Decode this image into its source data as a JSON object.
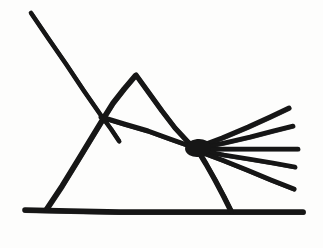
{
  "figure": {
    "title": "Hand-drawn line figure",
    "background_color": "#fdfdfc",
    "ink_color": "#161616",
    "canvas": {
      "width": 323,
      "height": 248
    },
    "stroke_width": 5.2,
    "parts": [
      {
        "name": "long-diagonal",
        "label": "Long diagonal from upper left"
      },
      {
        "name": "baseline",
        "label": "Horizontal baseline"
      },
      {
        "name": "triangle-left-leg",
        "label": "Triangle left leg"
      },
      {
        "name": "triangle-right-leg",
        "label": "Triangle right leg"
      },
      {
        "name": "peak-left-slope",
        "label": "Small peak left slope"
      },
      {
        "name": "peak-right-slope",
        "label": "Small peak right slope"
      },
      {
        "name": "crossbar",
        "label": "Crossbar to fan node"
      },
      {
        "name": "fan-rays",
        "label": "Five-ray fan"
      }
    ],
    "points": {
      "diagonal_start": [
        31,
        13
      ],
      "crossing": [
        103,
        118
      ],
      "diagonal_end": [
        118,
        140
      ],
      "baseline_left": [
        25,
        210
      ],
      "baseline_right": [
        303,
        212
      ],
      "triangle_left_foot": [
        46,
        210
      ],
      "triangle_right_foot": [
        231,
        212
      ],
      "peak_apex": [
        136,
        75
      ],
      "fan_node": [
        197,
        148
      ]
    },
    "geometry": {
      "strokes": [
        {
          "name": "long-diagonal",
          "width": 4.6,
          "points": [
            [
              31,
              13
            ],
            [
              48,
              38
            ],
            [
              66,
              64
            ],
            [
              84,
              91
            ],
            [
              100,
              114
            ],
            [
              111,
              129
            ],
            [
              119,
              141
            ]
          ]
        },
        {
          "name": "baseline",
          "width": 5.6,
          "points": [
            [
              25,
              210
            ],
            [
              70,
              211
            ],
            [
              120,
              212
            ],
            [
              170,
              212
            ],
            [
              215,
              212
            ],
            [
              260,
              212
            ],
            [
              303,
              212
            ]
          ]
        },
        {
          "name": "triangle-left-leg",
          "width": 5.4,
          "points": [
            [
              46,
              210
            ],
            [
              62,
              186
            ],
            [
              78,
              160
            ],
            [
              92,
              137
            ],
            [
              103,
              119
            ],
            [
              113,
              103
            ],
            [
              124,
              89
            ],
            [
              135,
              76
            ]
          ]
        },
        {
          "name": "peak-right-slope",
          "width": 5.2,
          "points": [
            [
              136,
              75
            ],
            [
              149,
              93
            ],
            [
              162,
              111
            ],
            [
              175,
              128
            ],
            [
              188,
              142
            ],
            [
              197,
              149
            ]
          ]
        },
        {
          "name": "crossbar",
          "width": 5.0,
          "points": [
            [
              101,
              117
            ],
            [
              124,
              124
            ],
            [
              148,
              131
            ],
            [
              170,
              139
            ],
            [
              187,
              145
            ],
            [
              198,
              149
            ]
          ]
        },
        {
          "name": "triangle-right-leg",
          "width": 5.4,
          "points": [
            [
              197,
              149
            ],
            [
              206,
              164
            ],
            [
              215,
              180
            ],
            [
              224,
              197
            ],
            [
              231,
              211
            ]
          ]
        },
        {
          "name": "fan-ray-1",
          "width": 4.8,
          "points": [
            [
              198,
              147
            ],
            [
              222,
              138
            ],
            [
              248,
              127
            ],
            [
              270,
              117
            ],
            [
              289,
              108
            ]
          ]
        },
        {
          "name": "fan-ray-2",
          "width": 4.6,
          "points": [
            [
              199,
              148
            ],
            [
              224,
              143
            ],
            [
              250,
              137
            ],
            [
              273,
              131
            ],
            [
              293,
              126
            ]
          ]
        },
        {
          "name": "fan-ray-3",
          "width": 4.6,
          "points": [
            [
              200,
              149
            ],
            [
              226,
              149
            ],
            [
              252,
              149
            ],
            [
              276,
              149
            ],
            [
              298,
              149
            ]
          ]
        },
        {
          "name": "fan-ray-4",
          "width": 4.6,
          "points": [
            [
              199,
              150
            ],
            [
              224,
              155
            ],
            [
              249,
              159
            ],
            [
              273,
              163
            ],
            [
              295,
              167
            ]
          ]
        },
        {
          "name": "fan-ray-5",
          "width": 4.8,
          "points": [
            [
              198,
              151
            ],
            [
              222,
              160
            ],
            [
              247,
              170
            ],
            [
              271,
              180
            ],
            [
              294,
              189
            ]
          ]
        }
      ],
      "node_blob": {
        "cx": 198,
        "cy": 148,
        "rx": 13,
        "ry": 9,
        "rotation": -6
      }
    }
  }
}
